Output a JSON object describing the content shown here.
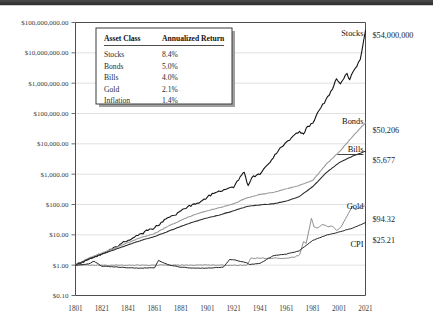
{
  "chart_data": {
    "type": "line",
    "title": "",
    "xlabel": "",
    "ylabel": "",
    "log_scale_y": true,
    "grid": true,
    "legend_position": "top-left-inset",
    "xlim": [
      1801,
      2021
    ],
    "ylim": [
      0.1,
      100000000
    ],
    "x_ticks": [
      "1801",
      "1821",
      "1841",
      "1861",
      "1881",
      "1901",
      "1921",
      "1941",
      "1961",
      "1981",
      "2001",
      "2021"
    ],
    "y_ticks": [
      "$100,000,000.00",
      "$10,000,000.00",
      "$1,000,000.00",
      "$100,000.00",
      "$10,000.00",
      "$1,000.00",
      "$100.00",
      "$10.00",
      "$1.00",
      "$0.10"
    ],
    "series": [
      {
        "name": "Stocks",
        "color": "#141414",
        "width": 1.1,
        "end_label": "$54,000,000",
        "x": [
          1801,
          1806,
          1811,
          1816,
          1821,
          1826,
          1831,
          1836,
          1841,
          1846,
          1851,
          1856,
          1861,
          1866,
          1871,
          1876,
          1881,
          1886,
          1891,
          1896,
          1901,
          1906,
          1911,
          1916,
          1921,
          1926,
          1929,
          1932,
          1936,
          1941,
          1946,
          1951,
          1956,
          1961,
          1966,
          1971,
          1974,
          1976,
          1981,
          1986,
          1991,
          1996,
          1999,
          2002,
          2007,
          2009,
          2013,
          2017,
          2021
        ],
        "y": [
          1,
          1.25,
          1.55,
          2.0,
          2.4,
          3.0,
          4.0,
          5.2,
          6.6,
          8.5,
          11,
          14,
          17,
          26,
          37,
          44,
          62,
          83,
          105,
          125,
          175,
          230,
          270,
          330,
          360,
          830,
          1150,
          420,
          880,
          980,
          1900,
          3400,
          7200,
          11500,
          18000,
          26000,
          21000,
          33000,
          48000,
          130000,
          290000,
          640000,
          1400000,
          950000,
          2100000,
          1300000,
          3000000,
          6000000,
          54000000
        ]
      },
      {
        "name": "Bonds",
        "color": "#9a9a9a",
        "width": 1.1,
        "end_label": "$50,206",
        "x": [
          1801,
          1811,
          1821,
          1831,
          1841,
          1851,
          1861,
          1871,
          1881,
          1891,
          1901,
          1911,
          1921,
          1931,
          1941,
          1951,
          1961,
          1971,
          1981,
          1991,
          2001,
          2011,
          2021
        ],
        "y": [
          1,
          1.7,
          2.5,
          3.7,
          5.6,
          8.3,
          11,
          19,
          30,
          46,
          62,
          80,
          105,
          165,
          215,
          250,
          330,
          430,
          620,
          2100,
          5400,
          17000,
          50206
        ]
      },
      {
        "name": "Bills",
        "color": "#2d2d2d",
        "width": 1.1,
        "end_label": "$5,677",
        "x": [
          1801,
          1811,
          1821,
          1831,
          1841,
          1851,
          1861,
          1871,
          1881,
          1891,
          1901,
          1911,
          1921,
          1931,
          1941,
          1951,
          1961,
          1971,
          1981,
          1991,
          2001,
          2011,
          2021
        ],
        "y": [
          1,
          1.6,
          2.3,
          3.3,
          4.7,
          6.6,
          8.8,
          13,
          19,
          27,
          36,
          46,
          62,
          86,
          97,
          105,
          130,
          185,
          390,
          1100,
          2400,
          3900,
          5677
        ]
      },
      {
        "name": "Gold",
        "color": "#8f8f8f",
        "width": 1.0,
        "end_label": "$94.32",
        "x": [
          1801,
          1821,
          1841,
          1861,
          1864,
          1868,
          1881,
          1901,
          1921,
          1931,
          1934,
          1941,
          1951,
          1961,
          1968,
          1971,
          1974,
          1976,
          1980,
          1982,
          1985,
          1988,
          1992,
          1996,
          1999,
          2002,
          2006,
          2008,
          2011,
          2013,
          2016,
          2019,
          2021
        ],
        "y": [
          1,
          1.0,
          1.0,
          1.0,
          1.0,
          1.0,
          1.0,
          1.0,
          1.0,
          1.0,
          1.7,
          1.7,
          1.7,
          1.7,
          1.9,
          2.2,
          6.0,
          5.2,
          35,
          18,
          17,
          22,
          19,
          19,
          14,
          17,
          35,
          50,
          90,
          68,
          75,
          86,
          94.32
        ]
      },
      {
        "name": "CPI",
        "color": "#242424",
        "width": 1.0,
        "end_label": "$25.21",
        "x": [
          1801,
          1811,
          1815,
          1821,
          1831,
          1841,
          1851,
          1861,
          1864,
          1866,
          1871,
          1881,
          1891,
          1901,
          1913,
          1918,
          1921,
          1931,
          1933,
          1941,
          1946,
          1951,
          1961,
          1971,
          1981,
          1991,
          2001,
          2011,
          2021
        ],
        "y": [
          1,
          1.1,
          1.35,
          0.92,
          0.88,
          0.82,
          0.8,
          0.82,
          1.45,
          1.3,
          1.05,
          0.85,
          0.8,
          0.8,
          0.85,
          1.55,
          1.5,
          1.2,
          1.05,
          1.15,
          1.55,
          2.05,
          2.3,
          3.0,
          6.6,
          9.6,
          12.5,
          16.5,
          25.21
        ]
      }
    ]
  },
  "legend": {
    "headers": [
      "Asset Class",
      "Annualized Return"
    ],
    "rows": [
      {
        "asset": "Stocks",
        "ret": "8.4%"
      },
      {
        "asset": "Bonds",
        "ret": "5.0%"
      },
      {
        "asset": "Bills",
        "ret": "4.0%"
      },
      {
        "asset": "Gold",
        "ret": "2.1%"
      },
      {
        "asset": "Inflation",
        "ret": "1.4%"
      }
    ]
  }
}
